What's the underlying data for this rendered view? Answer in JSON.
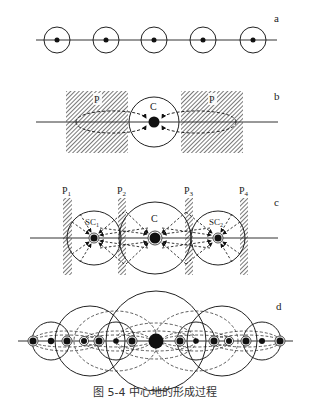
{
  "panels": {
    "a": {
      "label": "a"
    },
    "b": {
      "label": "b",
      "p_left": "P",
      "p_right": "P",
      "center": "C"
    },
    "c": {
      "label": "c",
      "p1": "P",
      "p1_sub": "1",
      "p2": "P",
      "p2_sub": "2",
      "p3": "P",
      "p3_sub": "3",
      "p4": "P",
      "p4_sub": "4",
      "sc1": "SC",
      "sc1_sub": "1",
      "center": "C",
      "sc2": "SC",
      "sc2_sub": "2"
    },
    "d": {
      "label": "d"
    }
  },
  "caption": "图 5-4  中心地的形成过程"
}
